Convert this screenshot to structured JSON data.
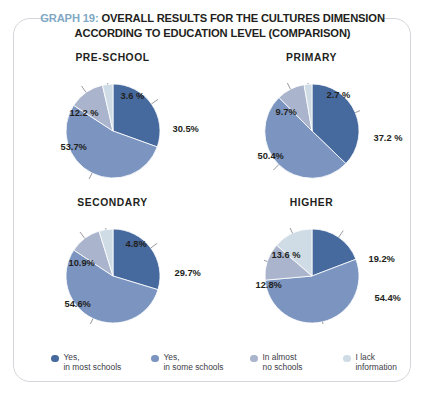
{
  "header": {
    "graph_number": "GRAPH 19:",
    "title_line1": " OVERALL RESULTS FOR THE CULTURES DIMENSION",
    "title_line2": "ACCORDING TO EDUCATION LEVEL (COMPARISON)",
    "graph_number_color": "#7fa8c4",
    "title_color": "#231f20"
  },
  "palette": {
    "series1": "#46699e",
    "series2": "#7b95c0",
    "series3": "#aab4cc",
    "series4": "#cfdce5",
    "border": "#d3d6da"
  },
  "legend": {
    "items": [
      {
        "label": "Yes,\nin most schools",
        "color": "#46699e"
      },
      {
        "label": "Yes,\nin some schools",
        "color": "#7b95c0"
      },
      {
        "label": "In almost\nno schools",
        "color": "#aab4cc"
      },
      {
        "label": "I lack\ninformation",
        "color": "#cfdce5"
      }
    ]
  },
  "chart_data": [
    {
      "type": "pie",
      "title": "PRE-SCHOOL",
      "categories": [
        "Yes, in most schools",
        "Yes, in some schools",
        "In almost no schools",
        "I lack information"
      ],
      "values": [
        30.5,
        53.7,
        12.2,
        3.6
      ],
      "labels": [
        "30.5%",
        "53.7%",
        "12.2 %",
        "3.6 %"
      ],
      "colors": [
        "#46699e",
        "#7b95c0",
        "#aab4cc",
        "#cfdce5"
      ],
      "start_angle_deg": 0,
      "direction": "clockwise"
    },
    {
      "type": "pie",
      "title": "PRIMARY",
      "categories": [
        "Yes, in most schools",
        "Yes, in some schools",
        "In almost no schools",
        "I lack information"
      ],
      "values": [
        37.2,
        50.4,
        9.7,
        2.7
      ],
      "labels": [
        "37.2 %",
        "50.4%",
        "9.7%",
        "2.7 %"
      ],
      "colors": [
        "#46699e",
        "#7b95c0",
        "#aab4cc",
        "#cfdce5"
      ],
      "start_angle_deg": 0,
      "direction": "clockwise"
    },
    {
      "type": "pie",
      "title": "SECONDARY",
      "categories": [
        "Yes, in most schools",
        "Yes, in some schools",
        "In almost no schools",
        "I lack information"
      ],
      "values": [
        29.7,
        54.6,
        10.9,
        4.8
      ],
      "labels": [
        "29.7%",
        "54.6%",
        "10.9%",
        "4.8%"
      ],
      "colors": [
        "#46699e",
        "#7b95c0",
        "#aab4cc",
        "#cfdce5"
      ],
      "start_angle_deg": 0,
      "direction": "clockwise"
    },
    {
      "type": "pie",
      "title": "HIGHER",
      "categories": [
        "Yes, in most schools",
        "Yes, in some schools",
        "In almost no schools",
        "I lack information"
      ],
      "values": [
        19.2,
        54.4,
        12.8,
        13.6
      ],
      "labels": [
        "19.2%",
        "54.4%",
        "12.8%",
        "13.6 %"
      ],
      "colors": [
        "#46699e",
        "#7b95c0",
        "#aab4cc",
        "#cfdce5"
      ],
      "start_angle_deg": 0,
      "direction": "clockwise"
    }
  ],
  "label_positions": [
    [
      {
        "left": 108,
        "top": 41,
        "text_index": 0
      },
      {
        "left": -4,
        "top": 59,
        "text_index": 1
      },
      {
        "left": 5,
        "top": 25,
        "text_index": 2
      },
      {
        "left": 56,
        "top": 8,
        "text_index": 3
      }
    ],
    [
      {
        "left": 110,
        "top": 50,
        "text_index": 0
      },
      {
        "left": -6,
        "top": 68,
        "text_index": 1
      },
      {
        "left": 12,
        "top": 24,
        "text_index": 2
      },
      {
        "left": 63,
        "top": 7,
        "text_index": 3
      }
    ],
    [
      {
        "left": 110,
        "top": 40,
        "text_index": 0
      },
      {
        "left": 0,
        "top": 71,
        "text_index": 1
      },
      {
        "left": 4,
        "top": 30,
        "text_index": 2
      },
      {
        "left": 61,
        "top": 11,
        "text_index": 3
      }
    ],
    [
      {
        "left": 105,
        "top": 26,
        "text_index": 0
      },
      {
        "left": 111,
        "top": 65,
        "text_index": 1
      },
      {
        "left": -8,
        "top": 52,
        "text_index": 2
      },
      {
        "left": 8,
        "top": 22,
        "text_index": 3
      }
    ]
  ]
}
